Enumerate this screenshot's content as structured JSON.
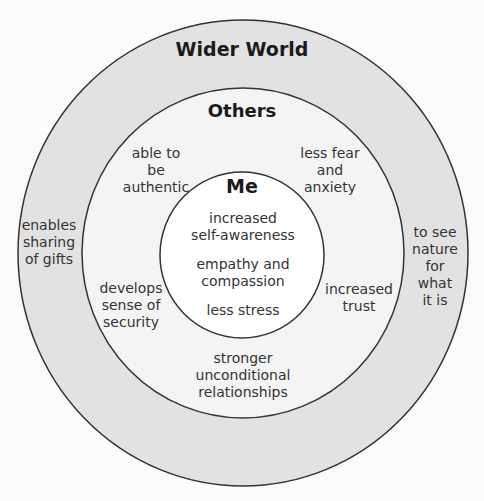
{
  "diagram": {
    "colors": {
      "background": "#fbfbfb",
      "outer_ring": "#e2e2e2",
      "middle_ring": "#f4f4f4",
      "inner_circle": "#ffffff",
      "stroke": "#333333"
    },
    "rings": {
      "wider_world": {
        "title": "Wider World",
        "items": [
          "enables\nsharing\nof gifts",
          "to see\nnature\nfor\nwhat\nit is"
        ]
      },
      "others": {
        "title": "Others",
        "items": [
          "able to\nbe\nauthentic",
          "less fear\nand\nanxiety",
          "develops\nsense of\nsecurity",
          "increased\ntrust",
          "stronger\nunconditional\nrelationships"
        ]
      },
      "me": {
        "title": "Me",
        "items": [
          "increased\nself-awareness",
          "empathy and\ncompassion",
          "less stress"
        ]
      }
    }
  }
}
